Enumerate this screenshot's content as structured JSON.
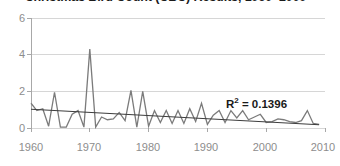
{
  "chart_data": {
    "type": "line",
    "title": "Christmas Bird Count (CBC) Results, 1960–2009",
    "xlabel": "",
    "ylabel": "",
    "xlim": [
      1960,
      2010
    ],
    "ylim": [
      0,
      6
    ],
    "yticks": [
      0,
      2,
      4,
      6
    ],
    "ytick_labels": [
      "0",
      "2",
      "4",
      "6"
    ],
    "xticks": [
      1960,
      1970,
      1980,
      1990,
      2000,
      2010
    ],
    "xtick_labels": [
      "1960",
      "1970",
      "1980",
      "1990",
      "2000",
      "2010"
    ],
    "grid": "horizontal",
    "legend": "none",
    "series": [
      {
        "name": "Birds per party hour",
        "color": "#7b7b7b",
        "x": [
          1960,
          1961,
          1962,
          1963,
          1964,
          1965,
          1966,
          1967,
          1968,
          1969,
          1970,
          1971,
          1972,
          1973,
          1974,
          1975,
          1976,
          1977,
          1978,
          1979,
          1980,
          1981,
          1982,
          1983,
          1984,
          1985,
          1986,
          1987,
          1988,
          1989,
          1990,
          1991,
          1992,
          1993,
          1994,
          1995,
          1996,
          1997,
          1998,
          1999,
          2000,
          2001,
          2002,
          2003,
          2004,
          2005,
          2006,
          2007,
          2008,
          2009
        ],
        "values": [
          1.35,
          0.95,
          1.05,
          0.1,
          1.95,
          0.05,
          0.05,
          0.75,
          0.95,
          0.05,
          4.3,
          0.05,
          0.6,
          0.45,
          0.5,
          0.85,
          0.4,
          2.05,
          0.05,
          2.0,
          0.1,
          0.95,
          0.3,
          0.95,
          0.25,
          0.95,
          0.25,
          1.05,
          0.35,
          1.35,
          0.2,
          0.7,
          0.95,
          0.3,
          0.95,
          0.55,
          0.95,
          0.45,
          0.6,
          0.75,
          0.3,
          0.35,
          0.5,
          0.45,
          0.35,
          0.3,
          0.4,
          0.95,
          0.25,
          0.2
        ]
      }
    ],
    "trendline": {
      "name": "linear-trend",
      "color": "#3d3d3d",
      "x": [
        1960,
        2009
      ],
      "values": [
        1.02,
        0.18
      ],
      "r_squared": 0.1396,
      "annotation": "R² = 0.1396",
      "annotation_prefix": "R",
      "annotation_sup": "2",
      "annotation_suffix": " = 0.1396"
    },
    "colors": {
      "series": "#7b7b7b",
      "trendline": "#3d3d3d",
      "grid": "#d6d6d6",
      "axis": "#a8a8a8",
      "tick_text": "#8d8d8d",
      "title_text": "#1a1a1a"
    }
  }
}
